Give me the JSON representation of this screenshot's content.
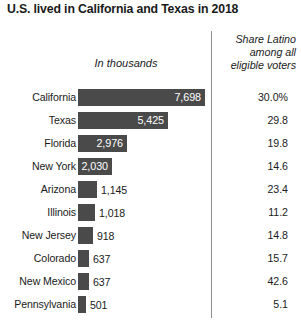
{
  "title": "U.S. lived in California and Texas in 2018",
  "headers": {
    "bars_header": "In thousands",
    "share_line1": "Share Latino",
    "share_line2": "among all",
    "share_line3": "eligible voters"
  },
  "colors": {
    "bar": "#4a4a4a",
    "text": "#1a1a1a",
    "divider": "#8e8e8e",
    "inside_label": "#ffffff"
  },
  "chart_data": {
    "type": "bar",
    "title": "U.S. lived in California and Texas in 2018",
    "xlabel": "In thousands",
    "ylabel": "",
    "orientation": "horizontal",
    "grid": false,
    "legend": null,
    "xlim": [
      0,
      7698
    ],
    "categories": [
      "California",
      "Texas",
      "Florida",
      "New York",
      "Arizona",
      "Illinois",
      "New Jersey",
      "Colorado",
      "New Mexico",
      "Pennsylvania"
    ],
    "values": [
      7698,
      5425,
      2976,
      2030,
      1145,
      1018,
      918,
      637,
      637,
      501
    ],
    "value_labels": [
      "7,698",
      "5,425",
      "2,976",
      "2,030",
      "1,145",
      "1,018",
      "918",
      "637",
      "637",
      "501"
    ],
    "series": [
      {
        "name": "In thousands",
        "values": [
          7698,
          5425,
          2976,
          2030,
          1145,
          1018,
          918,
          637,
          637,
          501
        ]
      },
      {
        "name": "Share Latino among all eligible voters",
        "values": [
          30.0,
          29.8,
          19.8,
          14.6,
          23.4,
          11.2,
          14.8,
          15.7,
          42.6,
          5.1
        ]
      }
    ],
    "share_labels": [
      "30.0%",
      "29.8",
      "19.8",
      "14.6",
      "23.4",
      "11.2",
      "14.8",
      "15.7",
      "42.6",
      "5.1"
    ]
  },
  "rows": [
    {
      "label": "California",
      "value_label": "7,698",
      "bar_px": 127,
      "label_inside": true,
      "share": "30.0%"
    },
    {
      "label": "Texas",
      "value_label": "5,425",
      "bar_px": 90,
      "label_inside": true,
      "share": "29.8"
    },
    {
      "label": "Florida",
      "value_label": "2,976",
      "bar_px": 49,
      "label_inside": true,
      "share": "19.8"
    },
    {
      "label": "New York",
      "value_label": "2,030",
      "bar_px": 34,
      "label_inside": true,
      "share": "14.6"
    },
    {
      "label": "Arizona",
      "value_label": "1,145",
      "bar_px": 19,
      "label_inside": false,
      "share": "23.4"
    },
    {
      "label": "Illinois",
      "value_label": "1,018",
      "bar_px": 17,
      "label_inside": false,
      "share": "11.2"
    },
    {
      "label": "New Jersey",
      "value_label": "918",
      "bar_px": 15,
      "label_inside": false,
      "share": "14.8"
    },
    {
      "label": "Colorado",
      "value_label": "637",
      "bar_px": 11,
      "label_inside": false,
      "share": "15.7"
    },
    {
      "label": "New Mexico",
      "value_label": "637",
      "bar_px": 11,
      "label_inside": false,
      "share": "42.6"
    },
    {
      "label": "Pennsylvania",
      "value_label": "501",
      "bar_px": 8,
      "label_inside": false,
      "share": "5.1"
    }
  ]
}
